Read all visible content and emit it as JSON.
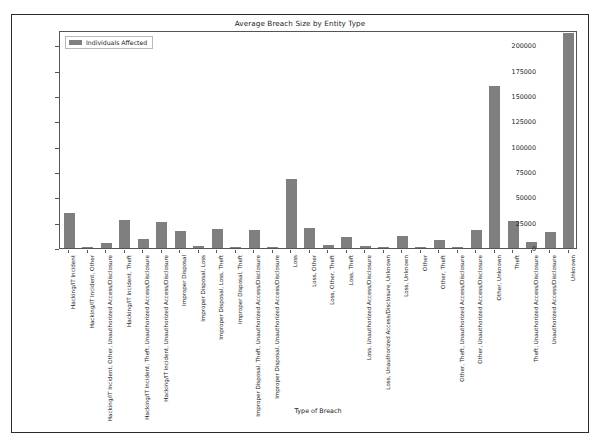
{
  "chart_data": {
    "type": "bar",
    "title": "Average Breach Size by Entity Type",
    "xlabel": "Type of Breach",
    "ylabel": "",
    "ylim": [
      0,
      215000
    ],
    "grid": false,
    "legend": {
      "position": "upper-left",
      "entries": [
        "Individuals Affected"
      ]
    },
    "yticks": [
      0,
      25000,
      50000,
      75000,
      100000,
      125000,
      150000,
      175000,
      200000
    ],
    "ytick_labels": [
      "0",
      "25000",
      "50000",
      "75000",
      "100000",
      "125000",
      "150000",
      "175000",
      "200000"
    ],
    "series_name": "Individuals Affected",
    "bar_color": "#7f7f7f",
    "categories": [
      "Hacking/IT Incident",
      "Hacking/IT Incident, Other",
      "Hacking/IT Incident, Other, Unauthorized Access/Disclosure",
      "Hacking/IT Incident, Theft",
      "Hacking/IT Incident, Theft, Unauthorized Access/Disclosure",
      "Hacking/IT Incident, Unauthorized Access/Disclosure",
      "Improper Disposal",
      "Improper Disposal, Loss",
      "Improper Disposal, Loss, Theft",
      "Improper Disposal, Theft",
      "Improper Disposal, Theft, Unauthorized Access/Disclosure",
      "Improper Disposal, Unauthorized Access/Disclosure",
      "Loss",
      "Loss, Other",
      "Loss, Other, Theft",
      "Loss, Theft",
      "Loss, Unauthorized Access/Disclosure",
      "Loss, Unauthorized Access/Disclosure, Unknown",
      "Loss, Unknown",
      "Other",
      "Other, Theft",
      "Other, Theft, Unauthorized Access/Disclosure",
      "Other, Unauthorized Access/Disclosure",
      "Other, Unknown",
      "Theft",
      "Theft, Unauthorized Access/Disclosure",
      "Unauthorized Access/Disclosure",
      "Unknown"
    ],
    "values": [
      35000,
      1200,
      5000,
      27500,
      8500,
      25500,
      17000,
      1500,
      19000,
      500,
      17500,
      1000,
      68000,
      20000,
      2500,
      11000,
      1500,
      500,
      11500,
      1200,
      8000,
      1000,
      18000,
      160000,
      26500,
      5500,
      16000,
      212000
    ]
  }
}
